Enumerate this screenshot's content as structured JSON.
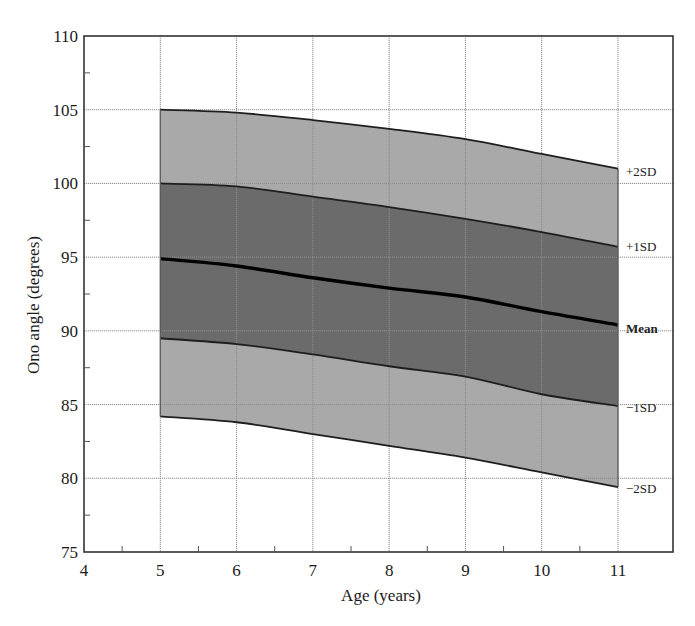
{
  "chart_data": {
    "type": "area",
    "title": "",
    "xlabel": "Age (years)",
    "ylabel": "Ono angle (degrees)",
    "xlim": [
      4,
      11
    ],
    "ylim": [
      75,
      110
    ],
    "xticks": [
      4,
      5,
      6,
      7,
      8,
      9,
      10,
      11
    ],
    "yticks": [
      75,
      80,
      85,
      90,
      95,
      100,
      105,
      110
    ],
    "x_minor_step": 0.5,
    "y_minor_step": 2.5,
    "grid": true,
    "x": [
      5,
      6,
      7,
      8,
      9,
      10,
      11
    ],
    "series": [
      {
        "name": "+2SD",
        "values": [
          105.0,
          104.8,
          104.3,
          103.7,
          103.0,
          102.0,
          101.0
        ]
      },
      {
        "name": "+1SD",
        "values": [
          100.0,
          99.8,
          99.1,
          98.4,
          97.6,
          96.7,
          95.7
        ]
      },
      {
        "name": "Mean",
        "values": [
          94.9,
          94.4,
          93.6,
          92.9,
          92.3,
          91.3,
          90.4
        ]
      },
      {
        "name": "-1SD",
        "values": [
          89.5,
          89.1,
          88.4,
          87.6,
          86.9,
          85.7,
          84.9
        ]
      },
      {
        "name": "-2SD",
        "values": [
          84.2,
          83.8,
          83.0,
          82.2,
          81.4,
          80.4,
          79.4
        ]
      }
    ],
    "bands": [
      {
        "from": "+2SD",
        "to": "+1SD",
        "color": "#a9a9a9"
      },
      {
        "from": "+1SD",
        "to": "-1SD",
        "color": "#6b6b6b"
      },
      {
        "from": "-1SD",
        "to": "-2SD",
        "color": "#a9a9a9"
      }
    ],
    "legend_position": "right-inline-labels",
    "colors": {
      "light_band": "#a9a9a9",
      "dark_band": "#6b6b6b",
      "mean_line": "#000000",
      "sd_line": "#1e1e1e",
      "grid": "#8c8c8c",
      "axis": "#333333"
    }
  },
  "labels": {
    "xlabel": "Age (years)",
    "ylabel": "Ono angle (degrees)",
    "band_labels": [
      {
        "key": "+2SD",
        "text": "+2SD",
        "y": 172
      },
      {
        "key": "+1SD",
        "text": "+1SD",
        "y": 247
      },
      {
        "key": "Mean",
        "text": "Mean",
        "y": 329
      },
      {
        "key": "-1SD",
        "text": "−1SD",
        "y": 408
      },
      {
        "key": "-2SD",
        "text": "−2SD",
        "y": 489
      }
    ]
  }
}
